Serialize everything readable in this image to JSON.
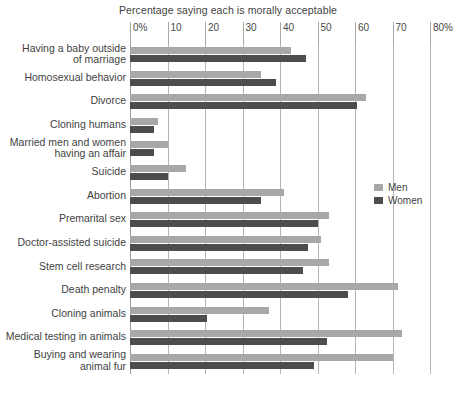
{
  "chart_data": {
    "type": "bar",
    "orientation": "horizontal",
    "title": "Percentage saying each is morally acceptable",
    "xlabel": "",
    "ylabel": "",
    "xlim": [
      0,
      80
    ],
    "xticks": [
      "0%",
      "10",
      "20",
      "30",
      "40",
      "50",
      "60",
      "70",
      "80%"
    ],
    "xtick_values": [
      0,
      10,
      20,
      30,
      40,
      50,
      60,
      70,
      80
    ],
    "grid": "vertical",
    "legend_position": "middle-right",
    "categories": [
      "Having a baby outside\nof marriage",
      "Homosexual behavior",
      "Divorce",
      "Cloning humans",
      "Married men and women\nhaving an affair",
      "Suicide",
      "Abortion",
      "Premarital sex",
      "Doctor-assisted suicide",
      "Stem cell research",
      "Death penalty",
      "Cloning animals",
      "Medical testing in animals",
      "Buying and wearing\nanimal fur"
    ],
    "series": [
      {
        "name": "Men",
        "color": "#a8a8a8",
        "values": [
          43,
          35,
          63,
          7.5,
          10,
          15,
          41,
          53,
          51,
          53,
          71.5,
          37,
          72.5,
          70
        ]
      },
      {
        "name": "Women",
        "color": "#4d4d4d",
        "values": [
          47,
          39,
          60.5,
          6.5,
          6.5,
          10,
          35,
          50,
          47.5,
          46,
          58,
          20.5,
          52.5,
          49
        ]
      }
    ]
  },
  "caption": {
    "text": ""
  }
}
